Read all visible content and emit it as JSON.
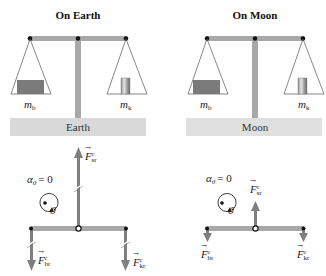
{
  "panels": [
    {
      "title": "On Earth",
      "ground_label": "Earth",
      "left_mass_label": "m",
      "left_mass_sub": "b",
      "right_mass_label": "m",
      "right_mass_sub": "k"
    },
    {
      "title": "On Moon",
      "ground_label": "Moon",
      "left_mass_label": "m",
      "left_mass_sub": "b",
      "right_mass_label": "m",
      "right_mass_sub": "k"
    }
  ],
  "fbd": [
    {
      "angular_accel": "α",
      "angular_accel_sub": "ϑ",
      "angular_accel_value": "= 0",
      "rotation_symbol": "ϑ",
      "force_up": {
        "symbol": "F",
        "sup": "c",
        "sub": "sr"
      },
      "force_left": {
        "symbol": "F",
        "sup": "c",
        "sub": "br"
      },
      "force_right": {
        "symbol": "F",
        "sup": "c",
        "sub": "kr"
      }
    },
    {
      "angular_accel": "α",
      "angular_accel_sub": "ϑ",
      "angular_accel_value": "= 0",
      "rotation_symbol": "ϑ",
      "force_up": {
        "symbol": "F",
        "sup": "c",
        "sub": "sr"
      },
      "force_left": {
        "symbol": "F",
        "sup": "c",
        "sub": "br"
      },
      "force_right": {
        "symbol": "F",
        "sup": "c",
        "sub": "kr"
      }
    }
  ],
  "colors": {
    "beam": "#a8a8a8",
    "ground": "#d9d9d9",
    "block_b": "#7a7a7a",
    "arrow": "#7f7f7f",
    "pivot": "#111111"
  }
}
